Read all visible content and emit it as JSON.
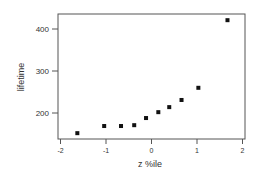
{
  "chart_data": {
    "type": "scatter",
    "title": "",
    "xlabel": "z %ile",
    "ylabel": "lifetime",
    "xlim": [
      -2,
      2
    ],
    "ylim": [
      150,
      430
    ],
    "x_ticks": [
      -2,
      -1,
      0,
      1,
      2
    ],
    "x_tick_labels": [
      "-2",
      "-1",
      "0",
      "1",
      "2"
    ],
    "y_ticks": [
      200,
      300,
      400
    ],
    "y_tick_labels": [
      "200",
      "300",
      "400"
    ],
    "grid": false,
    "legend": null,
    "marker": "square",
    "marker_color": "#111111",
    "series": [
      {
        "name": "lifetime vs z %ile",
        "points": [
          {
            "x": -1.63,
            "y": 152
          },
          {
            "x": -1.04,
            "y": 169
          },
          {
            "x": -0.67,
            "y": 169
          },
          {
            "x": -0.38,
            "y": 171
          },
          {
            "x": -0.12,
            "y": 188
          },
          {
            "x": 0.15,
            "y": 202
          },
          {
            "x": 0.39,
            "y": 214
          },
          {
            "x": 0.66,
            "y": 231
          },
          {
            "x": 1.03,
            "y": 260
          },
          {
            "x": 1.67,
            "y": 421
          }
        ]
      }
    ]
  }
}
